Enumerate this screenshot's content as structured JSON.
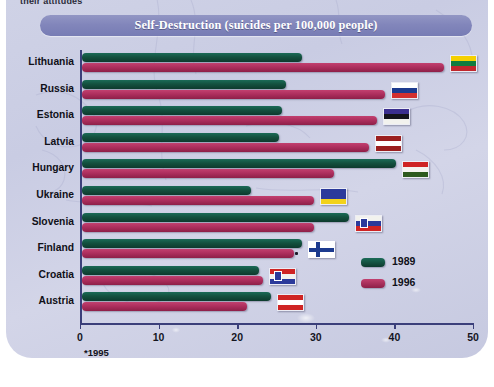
{
  "page": {
    "partial_top_text": "their attitudes",
    "footnote": "*1995"
  },
  "chart_data": {
    "type": "bar",
    "orientation": "horizontal",
    "title": "Self-Destruction (suicides per 100,000 people)",
    "xlabel": "",
    "ylabel": "",
    "xlim": [
      0,
      50
    ],
    "xticks": [
      0,
      10,
      20,
      30,
      40,
      50
    ],
    "xtick_labels": [
      "0",
      "10",
      "20",
      "30",
      "40",
      "50"
    ],
    "grid": false,
    "legend_position": "inside-right",
    "categories": [
      "Lithuania",
      "Russia",
      "Estonia",
      "Latvia",
      "Hungary",
      "Ukraine",
      "Slovenia",
      "Finland",
      "Croatia",
      "Austria"
    ],
    "series": [
      {
        "name": "1989",
        "color": "#14513f",
        "values": [
          28,
          26,
          25.5,
          25,
          40,
          21.5,
          34,
          28,
          22.5,
          24
        ]
      },
      {
        "name": "1996",
        "color": "#ae2f5e",
        "values": [
          46,
          38.5,
          37.5,
          36.5,
          32,
          29.5,
          29.5,
          27,
          23,
          21
        ]
      }
    ],
    "annotations": [
      "*1995"
    ]
  },
  "flags": {
    "Lithuania": [
      "#f5d000",
      "#0f7c3e",
      "#c1272d"
    ],
    "Russia": [
      "#ffffff",
      "#1c3a8e",
      "#d32f2f"
    ],
    "Estonia": [
      "#3b2f8f",
      "#14141c",
      "#f2f2ee"
    ],
    "Latvia": [
      "#9b1f1f",
      "#ffffff",
      "#9b1f1f"
    ],
    "Hungary": [
      "#cf2424",
      "#f4f4f0",
      "#2d5a1e"
    ],
    "Ukraine": [
      "#2b3a9b",
      "#2b3a9b",
      "#f2d21a"
    ],
    "Slovenia": [
      "#f2f2ee",
      "#2b3a9b",
      "#cf2424"
    ],
    "Finland": [
      "#ffffff",
      "#1c3a8e",
      "#ffffff"
    ],
    "Croatia": [
      "#cf2424",
      "#f2f2ee",
      "#2b3a9b"
    ],
    "Austria": [
      "#cf2424",
      "#ffffff",
      "#cf2424"
    ]
  },
  "legend": {
    "items": [
      {
        "label": "1989"
      },
      {
        "label": "1996"
      }
    ]
  }
}
